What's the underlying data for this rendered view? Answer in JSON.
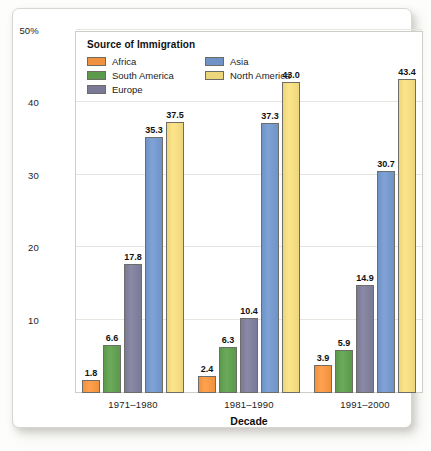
{
  "chart_data": {
    "type": "bar",
    "title": "",
    "xlabel": "Decade",
    "ylabel": "Percentage of immigrants",
    "categories": [
      "1971–1980",
      "1981–1990",
      "1991–2000"
    ],
    "legend_title": "Source of Immigration",
    "legend_position": "top-left inside plot",
    "grid": true,
    "ylim": [
      0,
      50
    ],
    "yticks": [
      "10",
      "20",
      "30",
      "40",
      "50%"
    ],
    "ytick_values": [
      10,
      20,
      30,
      40,
      50
    ],
    "series": [
      {
        "name": "Africa",
        "color": "#f0913e",
        "values": [
          1.8,
          2.4,
          3.9
        ],
        "labels": [
          "1.8",
          "2.4",
          "3.9"
        ]
      },
      {
        "name": "South America",
        "color": "#5a9a4a",
        "values": [
          6.6,
          6.3,
          5.9
        ],
        "labels": [
          "6.6",
          "6.3",
          "5.9"
        ]
      },
      {
        "name": "Europe",
        "color": "#7b7a96",
        "values": [
          17.8,
          10.4,
          14.9
        ],
        "labels": [
          "17.8",
          "10.4",
          "14.9"
        ]
      },
      {
        "name": "Asia",
        "color": "#6f93c7",
        "values": [
          35.3,
          37.3,
          30.7
        ],
        "labels": [
          "35.3",
          "37.3",
          "30.7"
        ]
      },
      {
        "name": "North America",
        "color": "#ecd57a",
        "values": [
          37.5,
          43.0,
          43.4
        ],
        "labels": [
          "37.5",
          "43.0",
          "43.4"
        ]
      }
    ]
  }
}
